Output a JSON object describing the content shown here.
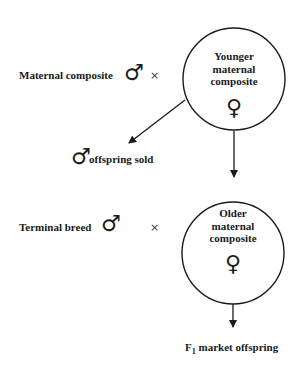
{
  "diagram": {
    "type": "breeding-scheme",
    "nodes": [
      {
        "id": "younger",
        "label_lines": [
          "Younger",
          "maternal",
          "composite"
        ],
        "symbol": "♀"
      },
      {
        "id": "older",
        "label_lines": [
          "Older",
          "maternal",
          "composite"
        ],
        "symbol": "♀"
      }
    ],
    "sires": [
      {
        "label": "Maternal composite",
        "symbol": "♂",
        "cross": "×"
      },
      {
        "label": "Terminal breed",
        "symbol": "♂",
        "cross": "×"
      }
    ],
    "outputs": {
      "male_offspring": {
        "symbol": "♂",
        "label": "offspring sold"
      },
      "market": {
        "prefix": "F",
        "subscript": "1",
        "label": "market offspring"
      }
    },
    "edges": [
      {
        "from": "younger",
        "to": "male_offspring"
      },
      {
        "from": "younger",
        "to": "older"
      },
      {
        "from": "older",
        "to": "market"
      }
    ]
  }
}
